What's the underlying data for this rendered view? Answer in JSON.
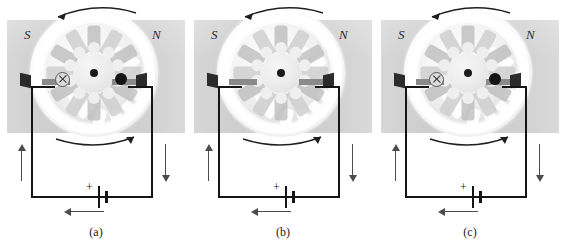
{
  "figure": {
    "panels": [
      {
        "key": "a",
        "label": "(a)",
        "pole_left": "S",
        "pole_right": "N",
        "battery_polarity": "+",
        "loop_left_marker": "cross",
        "loop_right_marker": "dot",
        "loop_left_marker_glyph": "×",
        "loop_right_marker_glyph": "•",
        "rotation_top": "counterclockwise-left-arrow",
        "rotation_bottom": "counterclockwise-right-arrow",
        "current_left_wire": "up",
        "current_right_wire": "down",
        "current_battery": "left"
      },
      {
        "key": "b",
        "label": "(b)",
        "pole_left": "S",
        "pole_right": "N",
        "battery_polarity": "+",
        "loop_left_marker": "edge-on",
        "loop_right_marker": "edge-on",
        "loop_left_marker_glyph": "",
        "loop_right_marker_glyph": "",
        "rotation_top": "counterclockwise-left-arrow",
        "rotation_bottom": "counterclockwise-right-arrow",
        "current_left_wire": "up",
        "current_right_wire": "down",
        "current_battery": "left"
      },
      {
        "key": "c",
        "label": "(c)",
        "pole_left": "S",
        "pole_right": "N",
        "battery_polarity": "+",
        "loop_left_marker": "cross",
        "loop_right_marker": "dot",
        "loop_left_marker_glyph": "×",
        "loop_right_marker_glyph": "•",
        "rotation_top": "counterclockwise-left-arrow",
        "rotation_bottom": "counterclockwise-right-arrow",
        "current_left_wire": "up",
        "current_right_wire": "down",
        "current_battery": "left"
      }
    ],
    "colors": {
      "magnet_band": "#d4d4d4",
      "wire": "#151515",
      "arrow": "#4c4c4c",
      "brush": "#2b2b2b",
      "background": "#ffffff",
      "label_text": "#222222"
    }
  }
}
